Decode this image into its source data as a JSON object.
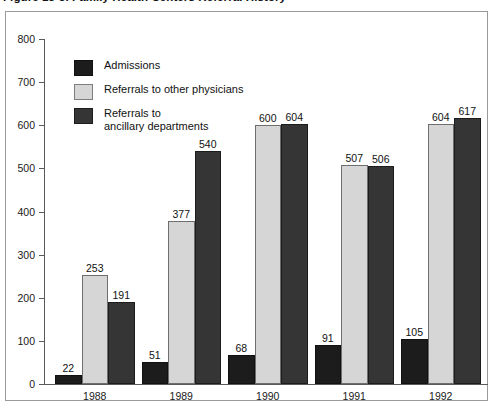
{
  "figure": {
    "title": "Figure 13-3.  Family Health Centers Referral History"
  },
  "legend": {
    "position": "top-left-inside",
    "items": [
      {
        "label": "Admissions",
        "key": "admissions",
        "color": "#1c1c1c"
      },
      {
        "label": "Referrals to other physicians",
        "key": "other",
        "color": "#d6d6d6"
      },
      {
        "label": "Referrals to\nancillary departments",
        "key": "ancillary",
        "color": "#353535"
      }
    ]
  },
  "axes": {
    "y_ticks": [
      "800",
      "700",
      "600",
      "500",
      "400",
      "300",
      "200",
      "100",
      "0"
    ],
    "x_ticks": [
      "1988",
      "1989",
      "1990",
      "1991",
      "1992"
    ]
  },
  "chart_data": {
    "type": "bar",
    "title": "Figure 13-3.  Family Health Centers Referral History",
    "xlabel": "",
    "ylabel": "",
    "ylim": [
      0,
      800
    ],
    "ytick_step": 100,
    "grid": false,
    "legend_position": "upper left",
    "categories": [
      "1988",
      "1989",
      "1990",
      "1991",
      "1992"
    ],
    "series": [
      {
        "name": "Admissions",
        "color": "#1c1c1c",
        "values": [
          22,
          51,
          68,
          91,
          105
        ]
      },
      {
        "name": "Referrals to other physicians",
        "color": "#d6d6d6",
        "values": [
          253,
          377,
          600,
          507,
          604
        ]
      },
      {
        "name": "Referrals to ancillary departments",
        "color": "#353535",
        "values": [
          191,
          540,
          604,
          506,
          617
        ]
      }
    ],
    "data_labels": [
      [
        "22",
        "253",
        "191"
      ],
      [
        "51",
        "377",
        "540"
      ],
      [
        "68",
        "600",
        "604"
      ],
      [
        "91",
        "507",
        "506"
      ],
      [
        "105",
        "604",
        "617"
      ]
    ]
  }
}
